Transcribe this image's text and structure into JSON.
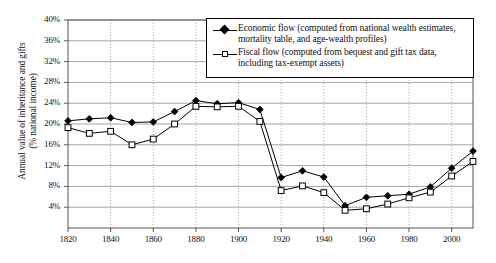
{
  "chart_data": {
    "type": "line",
    "title": "",
    "xlabel": "",
    "ylabel_line1": "Annual value of inheritance and gifts",
    "ylabel_line2": "(% national income)",
    "ylabel": "Annual value of inheritance and gifts (% national income)",
    "xlim": [
      1820,
      2010
    ],
    "ylim": [
      0,
      40
    ],
    "yticks": [
      "4%",
      "8%",
      "12%",
      "16%",
      "20%",
      "24%",
      "28%",
      "32%",
      "36%",
      "40%"
    ],
    "ytick_values": [
      4,
      8,
      12,
      16,
      20,
      24,
      28,
      32,
      36,
      40
    ],
    "xticks": [
      "1820",
      "1840",
      "1860",
      "1880",
      "1900",
      "1920",
      "1940",
      "1960",
      "1980",
      "2000"
    ],
    "xtick_values": [
      1820,
      1840,
      1860,
      1880,
      1900,
      1920,
      1940,
      1960,
      1980,
      2000
    ],
    "grid": {
      "horizontal": true,
      "vertical": true,
      "horizontal_style": "solid",
      "vertical_style": "dotted",
      "color": "#9a9a9a"
    },
    "legend_position": "top-right",
    "x": [
      1820,
      1830,
      1840,
      1850,
      1860,
      1870,
      1880,
      1890,
      1900,
      1910,
      1920,
      1930,
      1940,
      1950,
      1960,
      1970,
      1980,
      1990,
      2000,
      2010
    ],
    "series": [
      {
        "name": "Economic flow (computed from national wealth estimates, mortality table, and age-wealth profiles)",
        "short_name": "Economic flow",
        "marker": "filled-diamond",
        "color": "#000000",
        "values": [
          20.6,
          21.0,
          21.2,
          20.3,
          20.4,
          22.4,
          24.5,
          23.9,
          24.1,
          22.8,
          9.7,
          11.0,
          9.8,
          4.3,
          5.9,
          6.2,
          6.5,
          7.9,
          11.5,
          14.8
        ]
      },
      {
        "name": "Fiscal flow (computed from bequest and gift tax data, including tax-exempt assets)",
        "short_name": "Fiscal flow",
        "marker": "open-square",
        "color": "#000000",
        "values": [
          19.3,
          18.2,
          18.6,
          16.0,
          17.1,
          20.0,
          23.4,
          23.3,
          23.4,
          20.5,
          7.2,
          8.1,
          6.8,
          3.4,
          3.7,
          4.6,
          5.8,
          6.9,
          10.0,
          12.8
        ]
      }
    ],
    "legend": [
      {
        "marker": "filled-diamond",
        "label": "Economic flow (computed from national wealth estimates, mortality table, and age-wealth profiles)"
      },
      {
        "marker": "open-square",
        "label": "Fiscal flow (computed from bequest and gift tax data, including tax-exempt assets)"
      }
    ]
  }
}
